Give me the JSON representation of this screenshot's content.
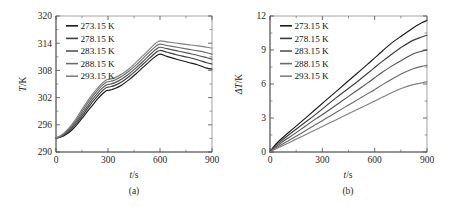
{
  "figure": {
    "panel_a_caption": "(a)",
    "panel_b_caption": "(b)",
    "legend_labels": [
      "273.15 K",
      "278.15 K",
      "283.15 K",
      "288.15 K",
      "293.15 K"
    ],
    "series_colors": [
      "#1c1c1c",
      "#3d3d3d",
      "#545454",
      "#6b6b6b",
      "#808080"
    ]
  },
  "chart_data": [
    {
      "type": "line",
      "panel": "(a)",
      "title": "",
      "xlabel": "t/s",
      "ylabel": "T/K",
      "xlim": [
        0,
        900
      ],
      "ylim": [
        290,
        320
      ],
      "xticks": [
        0,
        300,
        600,
        900
      ],
      "yticks": [
        290,
        296,
        302,
        308,
        314,
        320
      ],
      "x_minor_step": 150,
      "y_minor_step": 3,
      "grid": false,
      "legend_position": "top-left",
      "legend": [
        "273.15 K",
        "278.15 K",
        "283.15 K",
        "288.15 K",
        "293.15 K"
      ],
      "x": [
        0,
        30,
        60,
        90,
        120,
        150,
        180,
        210,
        240,
        270,
        290,
        300,
        315,
        340,
        380,
        420,
        460,
        500,
        540,
        575,
        600,
        640,
        700,
        760,
        820,
        870,
        900
      ],
      "series": [
        {
          "name": "273.15 K",
          "values": [
            293.1,
            293.3,
            293.9,
            294.8,
            296.0,
            297.4,
            298.9,
            300.3,
            301.7,
            302.9,
            303.5,
            303.6,
            303.7,
            304.0,
            304.8,
            305.9,
            307.2,
            308.6,
            310.0,
            311.1,
            311.6,
            311.1,
            310.4,
            309.8,
            309.2,
            308.5,
            308.3
          ]
        },
        {
          "name": "278.15 K",
          "values": [
            293.1,
            293.4,
            294.1,
            295.1,
            296.4,
            297.9,
            299.5,
            301.0,
            302.4,
            303.6,
            304.2,
            304.3,
            304.4,
            304.7,
            305.5,
            306.6,
            307.9,
            309.3,
            310.7,
            311.9,
            312.4,
            312.0,
            311.4,
            310.9,
            310.3,
            309.7,
            309.4
          ]
        },
        {
          "name": "283.15 K",
          "values": [
            293.1,
            293.5,
            294.3,
            295.4,
            296.8,
            298.4,
            300.0,
            301.6,
            303.0,
            304.2,
            304.8,
            304.9,
            305.0,
            305.3,
            306.1,
            307.2,
            308.5,
            309.9,
            311.4,
            312.6,
            313.1,
            312.8,
            312.3,
            311.8,
            311.3,
            310.8,
            310.5
          ]
        },
        {
          "name": "288.15 K",
          "values": [
            293.1,
            293.6,
            294.5,
            295.7,
            297.2,
            298.9,
            300.6,
            302.2,
            303.6,
            304.8,
            305.4,
            305.5,
            305.6,
            305.9,
            306.7,
            307.8,
            309.1,
            310.6,
            312.1,
            313.3,
            313.8,
            313.5,
            313.1,
            312.7,
            312.3,
            311.9,
            311.6
          ]
        },
        {
          "name": "293.15 K",
          "values": [
            293.1,
            293.7,
            294.7,
            296.0,
            297.6,
            299.4,
            301.1,
            302.7,
            304.1,
            305.3,
            305.9,
            306.0,
            306.1,
            306.4,
            307.2,
            308.3,
            309.7,
            311.2,
            312.7,
            314.0,
            314.5,
            314.3,
            314.0,
            313.7,
            313.4,
            313.1,
            312.9
          ]
        }
      ]
    },
    {
      "type": "line",
      "panel": "(b)",
      "title": "",
      "xlabel": "t/s",
      "ylabel": "ΔT/K",
      "xlim": [
        0,
        900
      ],
      "ylim": [
        0,
        12
      ],
      "xticks": [
        0,
        300,
        600,
        900
      ],
      "yticks": [
        0,
        3,
        6,
        9,
        12
      ],
      "x_minor_step": 150,
      "y_minor_step": 1.5,
      "grid": false,
      "legend_position": "top-left",
      "legend": [
        "273.15 K",
        "278.15 K",
        "283.15 K",
        "288.15 K",
        "293.15 K"
      ],
      "x": [
        0,
        20,
        50,
        90,
        140,
        200,
        260,
        320,
        380,
        440,
        500,
        560,
        600,
        640,
        700,
        760,
        820,
        870,
        900
      ],
      "series": [
        {
          "name": "273.15 K",
          "values": [
            0.0,
            0.45,
            0.95,
            1.5,
            2.15,
            2.95,
            3.75,
            4.55,
            5.35,
            6.15,
            6.95,
            7.75,
            8.3,
            8.85,
            9.65,
            10.3,
            10.95,
            11.4,
            11.6
          ]
        },
        {
          "name": "278.15 K",
          "values": [
            0.0,
            0.38,
            0.8,
            1.3,
            1.9,
            2.6,
            3.3,
            4.05,
            4.8,
            5.5,
            6.2,
            6.95,
            7.45,
            7.95,
            8.65,
            9.3,
            9.85,
            10.15,
            10.3
          ]
        },
        {
          "name": "283.15 K",
          "values": [
            0.0,
            0.3,
            0.65,
            1.1,
            1.6,
            2.25,
            2.9,
            3.5,
            4.15,
            4.8,
            5.45,
            6.1,
            6.55,
            7.0,
            7.6,
            8.15,
            8.65,
            8.9,
            9.0
          ]
        },
        {
          "name": "288.15 K",
          "values": [
            0.0,
            0.24,
            0.5,
            0.85,
            1.3,
            1.85,
            2.4,
            2.95,
            3.5,
            4.05,
            4.6,
            5.15,
            5.5,
            5.9,
            6.45,
            6.95,
            7.35,
            7.55,
            7.65
          ]
        },
        {
          "name": "293.15 K",
          "values": [
            0.0,
            0.18,
            0.4,
            0.68,
            1.05,
            1.5,
            1.95,
            2.4,
            2.85,
            3.3,
            3.75,
            4.2,
            4.5,
            4.8,
            5.25,
            5.65,
            5.95,
            6.1,
            6.2
          ]
        }
      ]
    }
  ]
}
